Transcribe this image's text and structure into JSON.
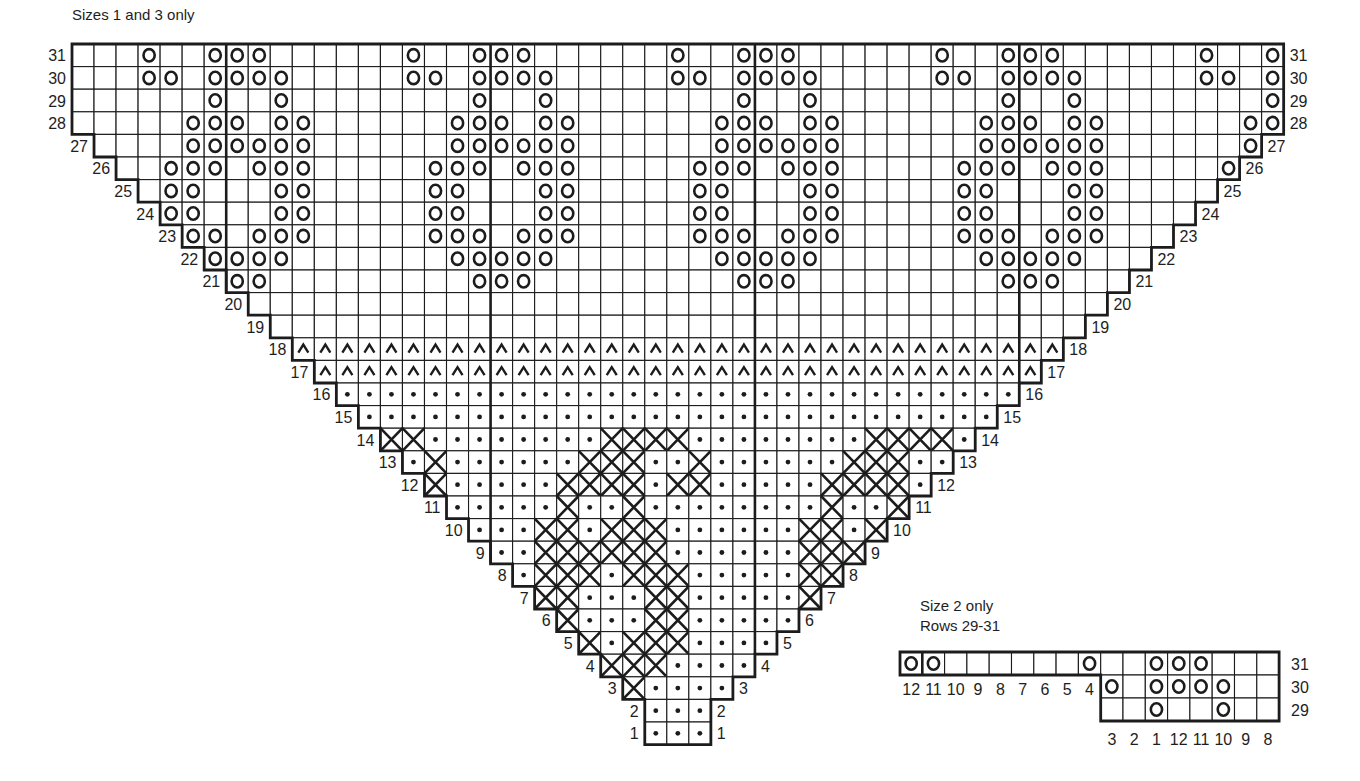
{
  "titles": {
    "main": "Sizes 1 and 3 only",
    "inset": "Size 2 only",
    "inset_sub": "Rows 29-31"
  },
  "legend_symbols": {
    "o": "circle (yarn over)",
    "^": "caret",
    "dot": "dot",
    "x": "cross"
  },
  "main_chart": {
    "origin_x": 72,
    "origin_y": 44,
    "cell_w": 22.03,
    "cell_h": 22.6,
    "total_cols": 55,
    "thick_col_lines": [
      7,
      19,
      31,
      43
    ],
    "rows": [
      {
        "row": 31,
        "start": 0,
        "end": 54,
        "fill": "blank",
        "o": [
          3,
          6,
          7,
          8,
          15,
          18,
          19,
          20,
          27,
          30,
          31,
          32,
          39,
          42,
          43,
          44,
          51,
          54
        ]
      },
      {
        "row": 30,
        "start": 0,
        "end": 54,
        "fill": "blank",
        "o": [
          3,
          4,
          6,
          7,
          8,
          9,
          15,
          16,
          18,
          19,
          20,
          21,
          27,
          28,
          30,
          31,
          32,
          33,
          39,
          40,
          42,
          43,
          44,
          45,
          51,
          52,
          54
        ]
      },
      {
        "row": 29,
        "start": 0,
        "end": 54,
        "fill": "blank",
        "o": [
          6,
          9,
          18,
          21,
          30,
          33,
          42,
          45,
          54
        ]
      },
      {
        "row": 28,
        "start": 0,
        "end": 54,
        "fill": "blank",
        "o": [
          5,
          6,
          7,
          9,
          10,
          17,
          18,
          19,
          21,
          22,
          29,
          30,
          31,
          33,
          34,
          41,
          42,
          43,
          45,
          46,
          53,
          54
        ]
      },
      {
        "row": 27,
        "start": 1,
        "end": 53,
        "fill": "blank",
        "o": [
          5,
          6,
          7,
          8,
          9,
          10,
          17,
          18,
          19,
          20,
          21,
          22,
          29,
          30,
          31,
          32,
          33,
          34,
          41,
          42,
          43,
          44,
          45,
          46,
          53
        ]
      },
      {
        "row": 26,
        "start": 2,
        "end": 52,
        "fill": "blank",
        "o": [
          4,
          5,
          6,
          8,
          9,
          10,
          16,
          17,
          18,
          20,
          21,
          22,
          28,
          29,
          30,
          32,
          33,
          34,
          40,
          41,
          42,
          44,
          45,
          46,
          52
        ]
      },
      {
        "row": 25,
        "start": 3,
        "end": 51,
        "fill": "blank",
        "o": [
          4,
          5,
          9,
          10,
          16,
          17,
          21,
          22,
          28,
          29,
          33,
          34,
          40,
          41,
          45,
          46
        ]
      },
      {
        "row": 24,
        "start": 4,
        "end": 50,
        "fill": "blank",
        "o": [
          4,
          5,
          9,
          10,
          16,
          17,
          21,
          22,
          28,
          29,
          33,
          34,
          40,
          41,
          45,
          46
        ]
      },
      {
        "row": 23,
        "start": 5,
        "end": 49,
        "fill": "blank",
        "o": [
          5,
          6,
          8,
          9,
          10,
          16,
          17,
          18,
          20,
          21,
          22,
          28,
          29,
          30,
          32,
          33,
          34,
          40,
          41,
          42,
          44,
          45,
          46
        ]
      },
      {
        "row": 22,
        "start": 6,
        "end": 48,
        "fill": "blank",
        "o": [
          6,
          7,
          8,
          9,
          17,
          18,
          19,
          20,
          21,
          29,
          30,
          31,
          32,
          33,
          41,
          42,
          43,
          44,
          45
        ]
      },
      {
        "row": 21,
        "start": 7,
        "end": 47,
        "fill": "blank",
        "o": [
          7,
          8,
          18,
          19,
          20,
          30,
          31,
          32,
          42,
          43,
          44
        ]
      },
      {
        "row": 20,
        "start": 8,
        "end": 46,
        "fill": "blank"
      },
      {
        "row": 19,
        "start": 9,
        "end": 45,
        "fill": "blank"
      },
      {
        "row": 18,
        "start": 10,
        "end": 44,
        "fill": "caret"
      },
      {
        "row": 17,
        "start": 11,
        "end": 43,
        "fill": "caret"
      },
      {
        "row": 16,
        "start": 12,
        "end": 42,
        "fill": "dot"
      },
      {
        "row": 15,
        "start": 13,
        "end": 41,
        "fill": "dot"
      },
      {
        "row": 14,
        "start": 14,
        "end": 40,
        "fill": "dot",
        "x": [
          14,
          15,
          24,
          25,
          26,
          27,
          36,
          37,
          38,
          39
        ]
      },
      {
        "row": 13,
        "start": 15,
        "end": 39,
        "fill": "dot",
        "x": [
          16,
          23,
          24,
          25,
          28,
          35,
          36,
          37
        ]
      },
      {
        "row": 12,
        "start": 16,
        "end": 38,
        "fill": "dot",
        "x": [
          16,
          22,
          23,
          24,
          25,
          27,
          28,
          34,
          35,
          36,
          37
        ]
      },
      {
        "row": 11,
        "start": 17,
        "end": 37,
        "fill": "dot",
        "x": [
          22,
          25,
          34,
          37
        ]
      },
      {
        "row": 10,
        "start": 18,
        "end": 36,
        "fill": "dot",
        "x": [
          21,
          22,
          24,
          25,
          26,
          33,
          34,
          36
        ]
      },
      {
        "row": 9,
        "start": 19,
        "end": 35,
        "fill": "dot",
        "x": [
          21,
          22,
          23,
          24,
          25,
          26,
          33,
          34,
          35
        ]
      },
      {
        "row": 8,
        "start": 20,
        "end": 34,
        "fill": "dot",
        "x": [
          21,
          22,
          23,
          25,
          26,
          27,
          33,
          34
        ]
      },
      {
        "row": 7,
        "start": 21,
        "end": 33,
        "fill": "dot",
        "x": [
          21,
          22,
          26,
          27,
          33
        ]
      },
      {
        "row": 6,
        "start": 22,
        "end": 32,
        "fill": "dot",
        "x": [
          22,
          26,
          27
        ]
      },
      {
        "row": 5,
        "start": 23,
        "end": 31,
        "fill": "dot",
        "x": [
          23,
          25,
          26,
          27
        ]
      },
      {
        "row": 4,
        "start": 24,
        "end": 30,
        "fill": "dot",
        "x": [
          24,
          25,
          26
        ]
      },
      {
        "row": 3,
        "start": 25,
        "end": 29,
        "fill": "dot",
        "x": [
          25
        ]
      },
      {
        "row": 2,
        "start": 26,
        "end": 28,
        "fill": "dot"
      },
      {
        "row": 1,
        "start": 26,
        "end": 28,
        "fill": "dot"
      }
    ]
  },
  "inset_chart": {
    "origin_x": 900,
    "origin_y": 652,
    "cell_w": 22.3,
    "cell_h": 23,
    "thick_col_lines": [
      1
    ],
    "rows": [
      {
        "row": 31,
        "start": 0,
        "end": 16,
        "o": [
          0,
          1,
          8,
          11,
          12,
          13
        ]
      },
      {
        "row": 30,
        "start": 9,
        "end": 16,
        "o": [
          9,
          11,
          12,
          13,
          14
        ]
      },
      {
        "row": 29,
        "start": 9,
        "end": 16,
        "o": [
          11,
          14
        ]
      }
    ],
    "row31_bottom_labels": [
      "12",
      "11",
      "10",
      "9",
      "8",
      "7",
      "6",
      "5",
      "4"
    ],
    "bottom_labels": [
      "3",
      "2",
      "1",
      "12",
      "11",
      "10",
      "9",
      "8"
    ]
  }
}
